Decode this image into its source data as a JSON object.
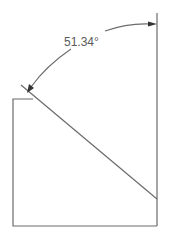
{
  "diagram": {
    "angle_label": "51.34°",
    "colors": {
      "line": "#6b6b6b",
      "text": "#5a5a5a",
      "arrow": "#333333",
      "background": "#ffffff"
    },
    "elements": [
      {
        "type": "vertical-reference-line"
      },
      {
        "type": "rectangle-outline"
      },
      {
        "type": "diagonal-line"
      },
      {
        "type": "angle-dimension-arc",
        "value": "51.34°"
      }
    ]
  }
}
